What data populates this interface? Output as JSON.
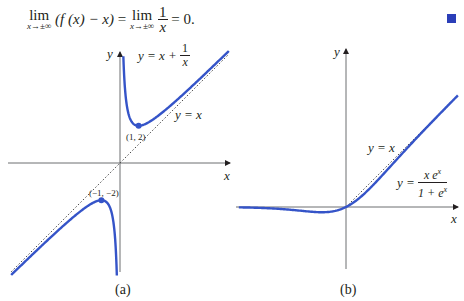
{
  "equation": {
    "lim_word": "lim",
    "lim_sub": "x→±∞",
    "lhs_paren": "(f (x) − x)",
    "equals1": "=",
    "rhs_num": "1",
    "rhs_den": "x",
    "result": "= 0."
  },
  "end_of_proof_marker": {
    "icon": "filled-square-icon",
    "color": "#2b3eb8"
  },
  "colors": {
    "curve": "#3554c8",
    "axis": "#6d6e71",
    "asymptote": "#4a4a4a",
    "text": "#231f20"
  },
  "chart_data": [
    {
      "type": "line",
      "panel_label": "(a)",
      "title": "",
      "xlabel": "x",
      "ylabel": "y",
      "function_label": {
        "lhs": "y = x +",
        "num": "1",
        "den": "x"
      },
      "asymptote_label": "y = x",
      "series": [
        {
          "name": "y = x + 1/x",
          "style": "solid",
          "color": "#3554c8",
          "branches": [
            {
              "x_range": [
                0.18,
                5.85
              ]
            },
            {
              "x_range": [
                -5.85,
                -0.17
              ]
            }
          ]
        },
        {
          "name": "y = x",
          "style": "dotted",
          "color": "#4a4a4a",
          "x_range": [
            -5.85,
            5.85
          ]
        }
      ],
      "annotated_points": [
        {
          "label": "(1, 2)",
          "x": 1,
          "y": 2
        },
        {
          "label": "(−1, −2)",
          "x": -1,
          "y": -2
        }
      ],
      "origin_px": [
        120,
        163
      ],
      "scale_px_per_unit": 18.6,
      "xlim": [
        -6,
        6
      ],
      "ylim": [
        -6,
        6
      ],
      "grid": false
    },
    {
      "type": "line",
      "panel_label": "(b)",
      "title": "",
      "xlabel": "x",
      "ylabel": "y",
      "function_label": {
        "lhs": "y =",
        "num": "x e",
        "num_sup": "x",
        "den": "1 + e",
        "den_sup": "x"
      },
      "asymptote_label": "y = x",
      "series": [
        {
          "name": "y = x e^x / (1 + e^x)",
          "style": "solid",
          "color": "#3554c8",
          "x_range": [
            -5.7,
            5.95
          ]
        },
        {
          "name": "y = x",
          "style": "dotted",
          "color": "#4a4a4a",
          "x_range": [
            0,
            5.9
          ]
        }
      ],
      "min_point": {
        "x": -1.28,
        "y": -0.28
      },
      "origin_px": [
        346,
        207
      ],
      "scale_px_per_unit": 18.8,
      "xlim": [
        -6,
        6
      ],
      "ylim": [
        -3.5,
        8.5
      ],
      "grid": false
    }
  ]
}
